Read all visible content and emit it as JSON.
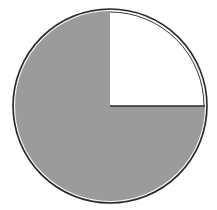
{
  "figure": {
    "total_parts": 4,
    "shaded_parts": 3,
    "unshaded_parts": 1,
    "shaded_fraction": "3/4",
    "colors": {
      "shaded": "#9b9b9b",
      "unshaded": "#ffffff",
      "outline": "#2a2a2a"
    }
  }
}
